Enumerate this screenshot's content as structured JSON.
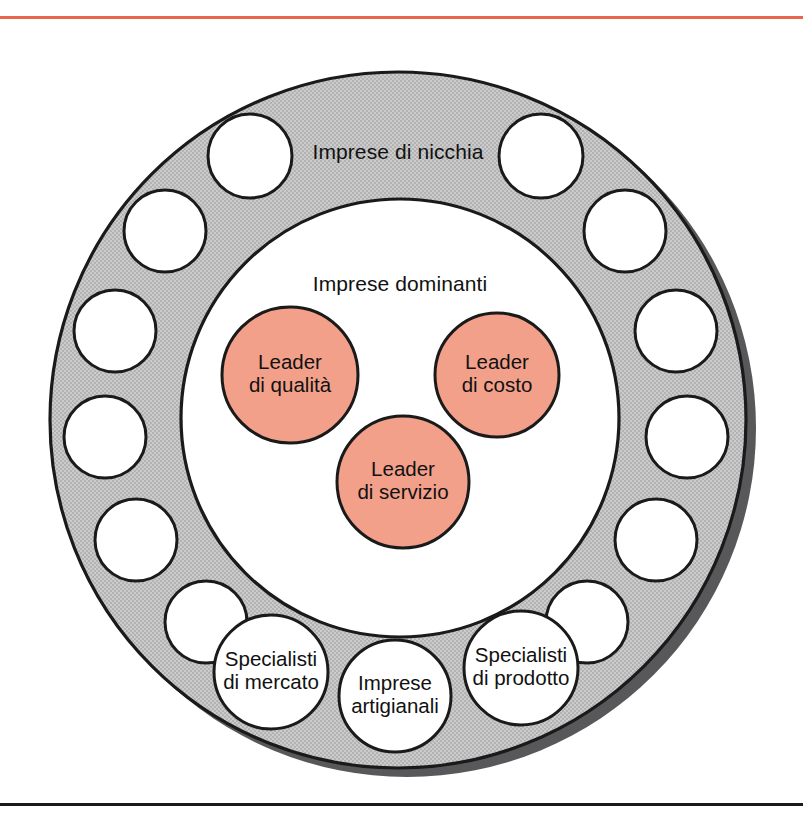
{
  "figure": {
    "kind": "concentric-circle-diagram",
    "language": "it",
    "top_rule_color": "#E8674A",
    "bottom_rule_color": "#1a1a1a"
  },
  "palette": {
    "ring_gray": "#C6C6C6",
    "ring_shadow": "#58585a",
    "leader_pink": "#F3A08B",
    "outline": "#1a1a1a",
    "hole_white": "#ffffff",
    "text": "#111111"
  },
  "labels": {
    "outer_ring": "Imprese di nicchia",
    "inner_disc": "Imprese dominanti"
  },
  "leaders": [
    {
      "id": "quality",
      "line1": "Leader",
      "line2": "di qualità",
      "cx": 290,
      "cy": 375,
      "r": 68
    },
    {
      "id": "cost",
      "line1": "Leader",
      "line2": "di costo",
      "cx": 497,
      "cy": 375,
      "r": 62
    },
    {
      "id": "service",
      "line1": "Leader",
      "line2": "di servizio",
      "cx": 403,
      "cy": 482,
      "r": 66
    }
  ],
  "ring_circles": [
    {
      "id": "niche-1",
      "label1": "",
      "label2": "",
      "cx": 250,
      "cy": 156,
      "r": 42
    },
    {
      "id": "niche-2",
      "label1": "",
      "label2": "",
      "cx": 541,
      "cy": 156,
      "r": 42
    },
    {
      "id": "niche-3",
      "label1": "",
      "label2": "",
      "cx": 165,
      "cy": 231,
      "r": 41
    },
    {
      "id": "niche-4",
      "label1": "",
      "label2": "",
      "cx": 625,
      "cy": 231,
      "r": 41
    },
    {
      "id": "niche-5",
      "label1": "",
      "label2": "",
      "cx": 115,
      "cy": 331,
      "r": 41
    },
    {
      "id": "niche-6",
      "label1": "",
      "label2": "",
      "cx": 676,
      "cy": 331,
      "r": 41
    },
    {
      "id": "niche-7",
      "label1": "",
      "label2": "",
      "cx": 105,
      "cy": 437,
      "r": 41
    },
    {
      "id": "niche-8",
      "label1": "",
      "label2": "",
      "cx": 687,
      "cy": 437,
      "r": 41
    },
    {
      "id": "niche-9",
      "label1": "",
      "label2": "",
      "cx": 136,
      "cy": 540,
      "r": 41
    },
    {
      "id": "niche-10",
      "label1": "",
      "label2": "",
      "cx": 656,
      "cy": 540,
      "r": 41
    },
    {
      "id": "niche-11",
      "label1": "",
      "label2": "",
      "cx": 206,
      "cy": 622,
      "r": 41
    },
    {
      "id": "niche-12",
      "label1": "",
      "label2": "",
      "cx": 587,
      "cy": 622,
      "r": 41
    },
    {
      "id": "market-specialists",
      "label1": "Specialisti",
      "label2": "di mercato",
      "cx": 271,
      "cy": 672,
      "r": 57
    },
    {
      "id": "craft-firms",
      "label1": "Imprese",
      "label2": "artigianali",
      "cx": 395,
      "cy": 696,
      "r": 56
    },
    {
      "id": "product-specialists",
      "label1": "Specialisti",
      "label2": "di prodotto",
      "cx": 521,
      "cy": 668,
      "r": 57
    }
  ],
  "geometry": {
    "outer_cx": 398,
    "outer_cy": 420,
    "outer_r": 348,
    "inner_cx": 400,
    "inner_cy": 418,
    "inner_r": 219
  }
}
